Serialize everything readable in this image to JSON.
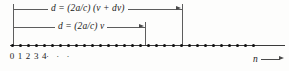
{
  "figure": {
    "type": "number-line-diagram",
    "background_color": "#fdfdfc",
    "line_color": "#5d5d5d",
    "dot_color": "#111111"
  },
  "dimensions": {
    "upper": {
      "label_prefix": "d",
      "label_equals": "=",
      "label": "d = (2a/c) (ν + dν)",
      "text_parts": {
        "d1": "d",
        "eq": " = ",
        "coef": "(2a/c) ",
        "paren_open": "(",
        "nu": "ν",
        "plus": " + ",
        "dnu": "dν",
        "paren_close": ")"
      },
      "start_x": 13,
      "end_x": 182,
      "y": 9
    },
    "lower": {
      "label": "d = (2a/c) ν",
      "text_parts": {
        "d1": "d",
        "eq": " = ",
        "coef": "(2a/c) ",
        "nu": "ν"
      },
      "start_x": 13,
      "end_x": 145,
      "y": 27
    }
  },
  "axis": {
    "y": 45,
    "start_x": 12,
    "line_end_x": 285,
    "dot_spacing": 8.05,
    "dot_count": 31,
    "tick_labels": [
      "0",
      "1",
      "2",
      "3",
      "4"
    ],
    "ellipsis": "· · ·",
    "variable_label": "n",
    "variable_label_x": 253,
    "variable_label_y": 56
  }
}
